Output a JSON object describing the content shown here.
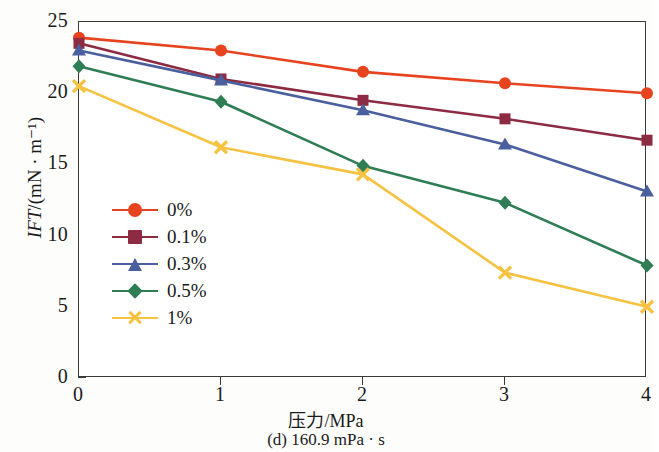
{
  "axis": {
    "y_title_prefix": "IFT",
    "y_title_suffix": "/(mN · m⁻¹)",
    "x_title": "压力/MPa",
    "caption": "(d) 160.9 mPa · s",
    "x_ticks": [
      "0",
      "1",
      "2",
      "3",
      "4"
    ],
    "y_ticks": [
      "25",
      "20",
      "15",
      "10",
      "5",
      "0"
    ]
  },
  "legend": {
    "items": [
      {
        "label": "0%",
        "color": "#E8431F",
        "marker": "circle"
      },
      {
        "label": "0.1%",
        "color": "#8C2B42",
        "marker": "square"
      },
      {
        "label": "0.3%",
        "color": "#4A5F9E",
        "marker": "triangle"
      },
      {
        "label": "0.5%",
        "color": "#2E7D54",
        "marker": "diamond"
      },
      {
        "label": "1%",
        "color": "#F5C242",
        "marker": "x"
      }
    ]
  },
  "chart_data": {
    "type": "line",
    "title": "(d) 160.9 mPa · s",
    "xlabel": "压力/MPa",
    "ylabel": "IFT/(mN · m⁻¹)",
    "xlim": [
      0,
      4
    ],
    "ylim": [
      0,
      25
    ],
    "xticks": [
      0,
      1,
      2,
      3,
      4
    ],
    "yticks": [
      0,
      5,
      10,
      15,
      20,
      25
    ],
    "grid": false,
    "legend_position": "center-left",
    "x": [
      0,
      1,
      2,
      3,
      4
    ],
    "series": [
      {
        "name": "0%",
        "color": "#E8431F",
        "marker": "circle",
        "values": [
          23.9,
          23.0,
          21.5,
          20.7,
          20.0
        ]
      },
      {
        "name": "0.1%",
        "color": "#8C2B42",
        "marker": "square",
        "values": [
          23.5,
          21.0,
          19.5,
          18.2,
          16.7
        ]
      },
      {
        "name": "0.3%",
        "color": "#4A5F9E",
        "marker": "triangle",
        "values": [
          23.0,
          20.9,
          18.8,
          16.4,
          13.1
        ]
      },
      {
        "name": "0.5%",
        "color": "#2E7D54",
        "marker": "diamond",
        "values": [
          21.9,
          19.4,
          14.9,
          12.3,
          7.9
        ]
      },
      {
        "name": "1%",
        "color": "#F5C242",
        "marker": "x",
        "values": [
          20.5,
          16.2,
          14.3,
          7.4,
          5.0
        ]
      }
    ]
  }
}
